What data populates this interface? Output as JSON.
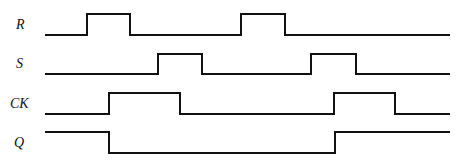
{
  "diagram": {
    "type": "timing-diagram",
    "signals": [
      {
        "name": "R",
        "label_x": 16,
        "label_y": 29,
        "high_y": 14,
        "low_y": 35,
        "start": 45,
        "end": 450,
        "initial": 0,
        "transitions": [
          87,
          130,
          241,
          285
        ]
      },
      {
        "name": "S",
        "label_x": 16,
        "label_y": 68,
        "high_y": 54,
        "low_y": 74,
        "start": 45,
        "end": 450,
        "initial": 0,
        "transitions": [
          158,
          202,
          311,
          356
        ]
      },
      {
        "name": "CK",
        "label_x": 10,
        "label_y": 108,
        "high_y": 93,
        "low_y": 114,
        "start": 45,
        "end": 450,
        "initial": 0,
        "transitions": [
          109,
          180,
          334,
          395
        ]
      },
      {
        "name": "Q",
        "label_x": 14,
        "label_y": 147,
        "high_y": 132,
        "low_y": 153,
        "start": 45,
        "end": 450,
        "initial": 1,
        "transitions": [
          109,
          335
        ]
      }
    ],
    "stroke_color": "#111111"
  }
}
